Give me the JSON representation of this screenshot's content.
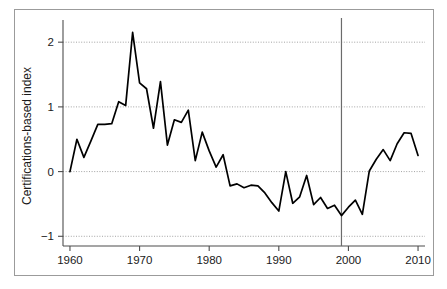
{
  "figure": {
    "background_color": "#ffffff",
    "frame_color": "#9b9b9b"
  },
  "chart_data": {
    "type": "line",
    "title": "",
    "subtitle": "",
    "xlabel": "",
    "ylabel": "Certifications-based index",
    "xlim": [
      1959,
      2011
    ],
    "ylim": [
      -1.15,
      2.25
    ],
    "xticks": [
      1960,
      1970,
      1980,
      1990,
      2000,
      2010
    ],
    "xtick_labels": [
      "1960",
      "1970",
      "1980",
      "1990",
      "2000",
      "2010"
    ],
    "yticks": [
      -1,
      0,
      1,
      2
    ],
    "ytick_labels": [
      "−1",
      "0",
      "1",
      "2"
    ],
    "grid": true,
    "grid_axis": "y",
    "grid_style": "dotted",
    "grid_color": "#8c8c8c",
    "legend": false,
    "legend_position": "none",
    "line_color": "#000000",
    "line_width": 1.7,
    "annotations": [
      {
        "name": "reference-line-1999",
        "type": "vline",
        "x": 1999,
        "label": "",
        "color": "#6b6b6b"
      }
    ],
    "x": [
      1960,
      1961,
      1962,
      1963,
      1964,
      1965,
      1966,
      1967,
      1968,
      1969,
      1970,
      1971,
      1972,
      1973,
      1974,
      1975,
      1976,
      1977,
      1978,
      1979,
      1980,
      1981,
      1982,
      1983,
      1984,
      1985,
      1986,
      1987,
      1988,
      1989,
      1990,
      1991,
      1992,
      1993,
      1994,
      1995,
      1996,
      1997,
      1998,
      1999,
      2000,
      2001,
      2002,
      2003,
      2004,
      2005,
      2006,
      2007,
      2008,
      2009,
      2010
    ],
    "values": [
      0.0,
      0.5,
      0.22,
      0.47,
      0.73,
      0.73,
      0.74,
      1.08,
      1.02,
      2.15,
      1.37,
      1.28,
      0.67,
      1.39,
      0.41,
      0.8,
      0.76,
      0.95,
      0.17,
      0.61,
      0.32,
      0.07,
      0.26,
      -0.22,
      -0.19,
      -0.25,
      -0.21,
      -0.22,
      -0.33,
      -0.48,
      -0.61,
      0.0,
      -0.49,
      -0.39,
      -0.06,
      -0.51,
      -0.4,
      -0.57,
      -0.52,
      -0.68,
      -0.55,
      -0.44,
      -0.66,
      0.01,
      0.19,
      0.34,
      0.17,
      0.43,
      0.6,
      0.59,
      0.25
    ],
    "series": [
      {
        "name": "Certifications-based index",
        "values": [
          0.0,
          0.5,
          0.22,
          0.47,
          0.73,
          0.73,
          0.74,
          1.08,
          1.02,
          2.15,
          1.37,
          1.28,
          0.67,
          1.39,
          0.41,
          0.8,
          0.76,
          0.95,
          0.17,
          0.61,
          0.32,
          0.07,
          0.26,
          -0.22,
          -0.19,
          -0.25,
          -0.21,
          -0.22,
          -0.33,
          -0.48,
          -0.61,
          0.0,
          -0.49,
          -0.39,
          -0.06,
          -0.51,
          -0.4,
          -0.57,
          -0.52,
          -0.68,
          -0.55,
          -0.44,
          -0.66,
          0.01,
          0.19,
          0.34,
          0.17,
          0.43,
          0.6,
          0.59,
          0.25
        ]
      }
    ]
  }
}
